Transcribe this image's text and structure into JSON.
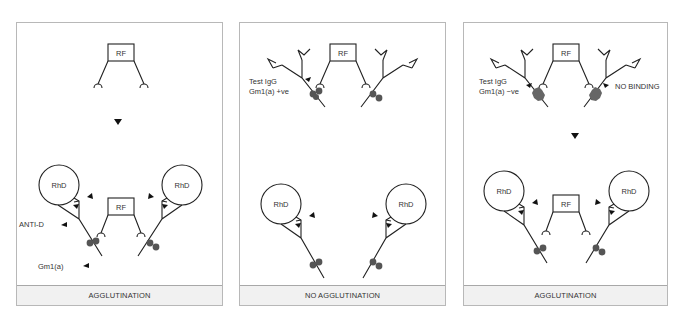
{
  "panels": [
    {
      "id": "panel-1",
      "caption": "AGGLUTINATION",
      "labels": {
        "rf_top": "RF",
        "rf_bottom": "RF",
        "cell_left": "RhD",
        "cell_right": "RhD",
        "anti_d": "ANTI-D",
        "gm": "Gm1(a)"
      }
    },
    {
      "id": "panel-2",
      "caption": "NO AGGLUTINATION",
      "labels": {
        "rf_top": "RF",
        "cell_left": "RhD",
        "cell_right": "RhD",
        "test_line1": "Test IgG",
        "test_line2": "Gm1(a) +ve"
      }
    },
    {
      "id": "panel-3",
      "caption": "AGGLUTINATION",
      "labels": {
        "rf_top": "RF",
        "rf_bottom": "RF",
        "cell_left": "RhD",
        "cell_right": "RhD",
        "test_line1": "Test IgG",
        "test_line2": "Gm1(a) −ve",
        "no_binding": "NO BINDING"
      }
    }
  ],
  "colors": {
    "stroke": "#222222",
    "gm_marker_positive": "#555555",
    "gm_marker_negative": "#666666",
    "caption_bg": "#f1f1f1",
    "border": "#b8b8b8"
  }
}
